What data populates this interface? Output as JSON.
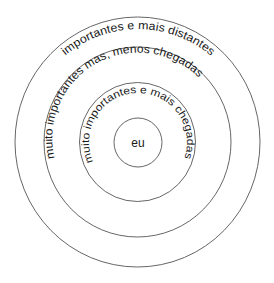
{
  "diagram": {
    "type": "concentric-circles",
    "center_label": "eu",
    "rings": [
      {
        "level": 1,
        "label": "muito importantes e mais chegadas"
      },
      {
        "level": 2,
        "label": "muito importantes mas, menos chegadas"
      },
      {
        "level": 3,
        "label": "importantes e mais distantes"
      }
    ],
    "colors": {
      "stroke": "#555555",
      "text": "#1a1a1a",
      "background": "#ffffff"
    }
  }
}
